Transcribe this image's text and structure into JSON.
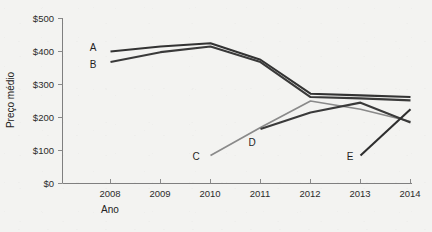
{
  "chart_data": {
    "type": "line",
    "title": "",
    "xlabel": "Ano",
    "ylabel": "Preço médio",
    "x": [
      2008,
      2009,
      2010,
      2011,
      2012,
      2013,
      2014
    ],
    "xticklabels": [
      "2008",
      "2009",
      "2010",
      "2011",
      "2012",
      "2013",
      "2014"
    ],
    "yticklabels": [
      "$0",
      "$100",
      "$200",
      "$300",
      "$400",
      "$500"
    ],
    "ytickvalues": [
      0,
      100,
      200,
      300,
      400,
      500
    ],
    "xlim": [
      2008,
      2014
    ],
    "ylim": [
      0,
      500
    ],
    "grid": false,
    "legend": "inline-labels",
    "series": [
      {
        "name": "A",
        "label": "A",
        "color": "#333333",
        "x": [
          2008,
          2009,
          2010,
          2011,
          2012,
          2013,
          2014
        ],
        "values": [
          400,
          415,
          425,
          375,
          272,
          267,
          262
        ]
      },
      {
        "name": "B",
        "label": "B",
        "color": "#3a3a3a",
        "x": [
          2008,
          2009,
          2010,
          2011,
          2012,
          2013,
          2014
        ],
        "values": [
          368,
          398,
          415,
          368,
          262,
          258,
          252
        ]
      },
      {
        "name": "C",
        "label": "C",
        "color": "#8a8a8a",
        "x": [
          2010,
          2011,
          2012,
          2013,
          2014
        ],
        "values": [
          85,
          170,
          250,
          225,
          188
        ]
      },
      {
        "name": "D",
        "label": "D",
        "color": "#3a3a3a",
        "x": [
          2011,
          2012,
          2013,
          2014
        ],
        "values": [
          165,
          215,
          245,
          185
        ]
      },
      {
        "name": "E",
        "label": "E",
        "color": "#2e2e2e",
        "x": [
          2013,
          2014
        ],
        "values": [
          85,
          225
        ]
      }
    ],
    "series_label_positions": [
      {
        "name": "A",
        "label": "A",
        "x_px": 93,
        "y_px": 51
      },
      {
        "name": "B",
        "label": "B",
        "x_px": 93,
        "y_px": 68
      },
      {
        "name": "C",
        "label": "C",
        "x_px": 196,
        "y_px": 160
      },
      {
        "name": "D",
        "label": "D",
        "x_px": 252,
        "y_px": 146
      },
      {
        "name": "E",
        "label": "E",
        "x_px": 350,
        "y_px": 160
      }
    ]
  },
  "colors": {
    "background": "#f3f3f1",
    "axis": "#7f7f7f",
    "text": "#222222",
    "line_dark": "#333333",
    "line_gray": "#8a8a8a"
  }
}
